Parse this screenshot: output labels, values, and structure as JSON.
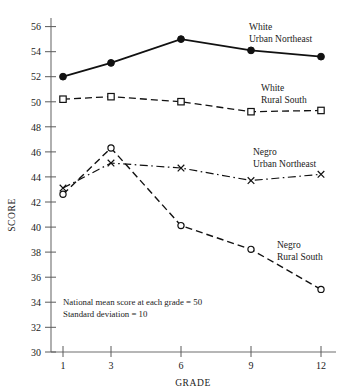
{
  "chart_data": {
    "type": "line",
    "title": "",
    "xlabel": "GRADE",
    "ylabel": "SCORE",
    "categories": [
      "1",
      "3",
      "6",
      "9",
      "12"
    ],
    "x": [
      1,
      3,
      6,
      9,
      12
    ],
    "ylim": [
      30,
      56
    ],
    "ytick_step": 2,
    "yticks": [
      30,
      32,
      34,
      36,
      38,
      40,
      42,
      44,
      46,
      48,
      50,
      52,
      54,
      56
    ],
    "xticks": [
      "1",
      "3",
      "6",
      "9",
      "12"
    ],
    "grid": false,
    "legend_position": "inline-right-of-series",
    "series": [
      {
        "name": "White Urban Northeast",
        "label_line1": "White",
        "label_line2": "Urban Northeast",
        "values": [
          52.0,
          53.1,
          55.0,
          54.1,
          53.6
        ],
        "marker": "filled-circle",
        "linestyle": "solid",
        "color": "#111111",
        "linewidth": 1.8
      },
      {
        "name": "White Rural South",
        "label_line1": "White",
        "label_line2": "Rural South",
        "values": [
          50.2,
          50.4,
          50.0,
          49.2,
          49.3
        ],
        "marker": "open-square",
        "linestyle": "dashed",
        "color": "#111111",
        "linewidth": 1.3
      },
      {
        "name": "Negro Urban Northeast",
        "label_line1": "Negro",
        "label_line2": "Urban Northeast",
        "values": [
          43.1,
          45.1,
          44.7,
          43.7,
          44.2
        ],
        "marker": "cross-x",
        "linestyle": "dash-dot",
        "color": "#111111",
        "linewidth": 1.2
      },
      {
        "name": "Negro Rural South",
        "label_line1": "Negro",
        "label_line2": "Rural South",
        "values": [
          42.6,
          46.3,
          40.1,
          38.2,
          35.0
        ],
        "marker": "open-circle",
        "linestyle": "dashed",
        "color": "#111111",
        "linewidth": 1.4
      }
    ],
    "annotations": [
      "National mean score at each grade = 50",
      "Standard deviation = 10"
    ]
  },
  "axis": {
    "y_title": "SCORE",
    "x_title": "GRADE"
  },
  "notes": {
    "line1": "National mean score at each grade = 50",
    "line2": "Standard deviation = 10"
  },
  "labels": {
    "white_urban_1": "White",
    "white_urban_2": "Urban Northeast",
    "white_rural_1": "White",
    "white_rural_2": "Rural South",
    "negro_urban_1": "Negro",
    "negro_urban_2": "Urban Northeast",
    "negro_rural_1": "Negro",
    "negro_rural_2": "Rural South"
  },
  "yticks": {
    "t56": "56",
    "t54": "54",
    "t52": "52",
    "t50": "50",
    "t48": "48",
    "t46": "46",
    "t44": "44",
    "t42": "42",
    "t40": "40",
    "t38": "38",
    "t36": "36",
    "t34": "34",
    "t32": "32",
    "t30": "30"
  },
  "xticks": {
    "g1": "1",
    "g3": "3",
    "g6": "6",
    "g9": "9",
    "g12": "12"
  }
}
